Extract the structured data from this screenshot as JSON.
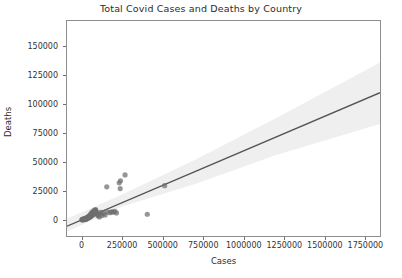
{
  "chart_data": {
    "type": "scatter",
    "title": "Total Covid Cases and Deaths by Country",
    "xlabel": "Cases",
    "ylabel": "Deaths",
    "xlim": [
      -90000,
      1840000
    ],
    "ylim": [
      -14000,
      172000
    ],
    "grid": false,
    "legend": null,
    "xticks": [
      0,
      250000,
      500000,
      750000,
      1000000,
      1250000,
      1500000,
      1750000
    ],
    "xtick_labels": [
      "0",
      "250000",
      "500000",
      "750000",
      "1000000",
      "1250000",
      "1500000",
      "1750000"
    ],
    "yticks": [
      0,
      25000,
      50000,
      75000,
      100000,
      125000,
      150000
    ],
    "ytick_labels": [
      "0",
      "25000",
      "50000",
      "75000",
      "100000",
      "125000",
      "150000"
    ],
    "marker_color": "#6e6e6e",
    "line_color": "#545454",
    "band_color": "#eeeeee",
    "frame_color": "#8d8d8d",
    "regression_line": {
      "x": [
        -90000,
        1840000
      ],
      "y": [
        -5500,
        110000
      ],
      "slope": 0.0599,
      "intercept": -110
    },
    "confidence_band": {
      "x": [
        -90000,
        250000,
        700000,
        1200000,
        1840000
      ],
      "upper": [
        1000,
        22000,
        52000,
        88000,
        136000
      ],
      "lower": [
        -10000,
        11500,
        31000,
        56000,
        83000
      ]
    },
    "points": [
      {
        "x": 3000,
        "y": 200
      },
      {
        "x": 6000,
        "y": 400
      },
      {
        "x": 9000,
        "y": 600
      },
      {
        "x": 12000,
        "y": 300
      },
      {
        "x": 15000,
        "y": 900
      },
      {
        "x": 18000,
        "y": 500
      },
      {
        "x": 21000,
        "y": 1200
      },
      {
        "x": 24000,
        "y": 800
      },
      {
        "x": 27000,
        "y": 1500
      },
      {
        "x": 30000,
        "y": 1000
      },
      {
        "x": 33000,
        "y": 2000
      },
      {
        "x": 36000,
        "y": 1400
      },
      {
        "x": 39000,
        "y": 2600
      },
      {
        "x": 42000,
        "y": 1800
      },
      {
        "x": 45000,
        "y": 3200
      },
      {
        "x": 48000,
        "y": 2400
      },
      {
        "x": 51000,
        "y": 4000
      },
      {
        "x": 54000,
        "y": 3000
      },
      {
        "x": 57000,
        "y": 5200
      },
      {
        "x": 60000,
        "y": 3600
      },
      {
        "x": 63000,
        "y": 6200
      },
      {
        "x": 66000,
        "y": 4400
      },
      {
        "x": 69000,
        "y": 7000
      },
      {
        "x": 72000,
        "y": 5000
      },
      {
        "x": 75000,
        "y": 7800
      },
      {
        "x": 78000,
        "y": 5600
      },
      {
        "x": 81000,
        "y": 8400
      },
      {
        "x": 84000,
        "y": 6200
      },
      {
        "x": 87000,
        "y": 8800
      },
      {
        "x": 90000,
        "y": 6800
      },
      {
        "x": 5000,
        "y": 100
      },
      {
        "x": 10000,
        "y": 250
      },
      {
        "x": 14000,
        "y": 150
      },
      {
        "x": 20000,
        "y": 700
      },
      {
        "x": 26000,
        "y": 450
      },
      {
        "x": 32000,
        "y": 1100
      },
      {
        "x": 38000,
        "y": 1600
      },
      {
        "x": 44000,
        "y": 2200
      },
      {
        "x": 50000,
        "y": 2800
      },
      {
        "x": 56000,
        "y": 3400
      },
      {
        "x": 62000,
        "y": 4200
      },
      {
        "x": 68000,
        "y": 5400
      },
      {
        "x": 74000,
        "y": 6000
      },
      {
        "x": 80000,
        "y": 7200
      },
      {
        "x": 86000,
        "y": 8000
      },
      {
        "x": 2000,
        "y": 50
      },
      {
        "x": 8000,
        "y": 120
      },
      {
        "x": 16000,
        "y": 350
      },
      {
        "x": 22000,
        "y": 600
      },
      {
        "x": 28000,
        "y": 900
      },
      {
        "x": 34000,
        "y": 1300
      },
      {
        "x": 40000,
        "y": 1700
      },
      {
        "x": 46000,
        "y": 2100
      },
      {
        "x": 52000,
        "y": 2500
      },
      {
        "x": 58000,
        "y": 3100
      },
      {
        "x": 64000,
        "y": 3800
      },
      {
        "x": 70000,
        "y": 4600
      },
      {
        "x": 76000,
        "y": 5800
      },
      {
        "x": 82000,
        "y": 6600
      },
      {
        "x": 88000,
        "y": 7400
      },
      {
        "x": 95000,
        "y": 5000
      },
      {
        "x": 100000,
        "y": 3500
      },
      {
        "x": 105000,
        "y": 4500
      },
      {
        "x": 110000,
        "y": 2500
      },
      {
        "x": 118000,
        "y": 6500
      },
      {
        "x": 125000,
        "y": 3800
      },
      {
        "x": 135000,
        "y": 5500
      },
      {
        "x": 145000,
        "y": 4200
      },
      {
        "x": 160000,
        "y": 6800
      },
      {
        "x": 175000,
        "y": 6200
      },
      {
        "x": 185000,
        "y": 7000
      },
      {
        "x": 195000,
        "y": 6600
      },
      {
        "x": 205000,
        "y": 7400
      },
      {
        "x": 215000,
        "y": 6000
      },
      {
        "x": 155000,
        "y": 28500
      },
      {
        "x": 232000,
        "y": 32000
      },
      {
        "x": 240000,
        "y": 33800
      },
      {
        "x": 238000,
        "y": 27000
      },
      {
        "x": 268000,
        "y": 38800
      },
      {
        "x": 405000,
        "y": 4800
      },
      {
        "x": 512000,
        "y": 29500
      }
    ]
  }
}
